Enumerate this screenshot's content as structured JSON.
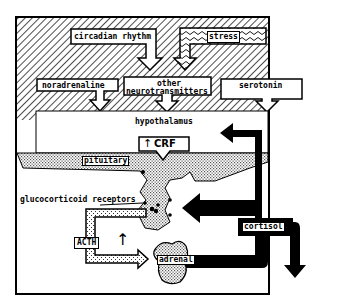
{
  "diagram": {
    "inputs": {
      "circadian_rhythm": "circadian rhythm",
      "stress": "stress"
    },
    "neurotransmitters": {
      "noradrenaline": "noradrenaline",
      "other_line1": "other",
      "other_line2": "neurotransmitters",
      "serotonin": "serotonin"
    },
    "regions": {
      "hypothalamus": "hypothalamus",
      "pituitary": "pituitary",
      "adrenal": "adrenal"
    },
    "hormones": {
      "crf": "CRF",
      "crf_arrow": "↑",
      "acth": "ACTH",
      "acth_arrow": "↑",
      "cortisol": "cortisol"
    },
    "annotations": {
      "glucocorticoid_receptors": "glucocorticoid receptors"
    },
    "colors": {
      "ink": "#000000",
      "paper": "#ffffff",
      "stipple": "#b8b8b8"
    }
  }
}
